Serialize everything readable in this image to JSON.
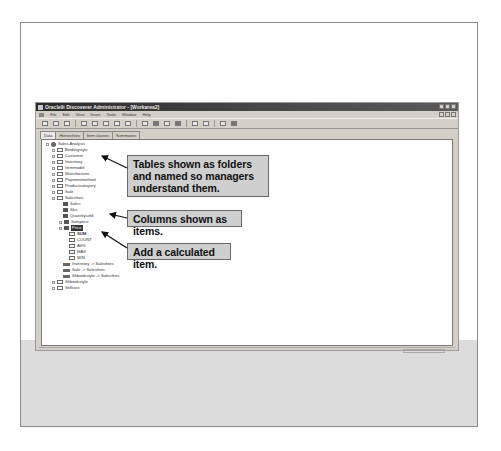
{
  "window": {
    "title": "Oracle9i Discoverer Administrator - [Workarea2]",
    "controls": [
      "minimize",
      "maximize",
      "close"
    ]
  },
  "menubar": {
    "items": [
      "File",
      "Edit",
      "View",
      "Insert",
      "Tools",
      "Window",
      "Help"
    ]
  },
  "toolbar": {
    "icons": [
      "delete-icon",
      "copy-icon",
      "paste-icon",
      "new-folder-icon",
      "new-item-icon",
      "new-join-icon",
      "filter-icon",
      "hierarchy-icon",
      "wand-icon",
      "refresh-icon",
      "properties-icon",
      "help-icon",
      "import-icon",
      "export-icon",
      "zoom-icon",
      "print-icon"
    ]
  },
  "tabs": [
    {
      "label": "Data",
      "active": true
    },
    {
      "label": "Hierarchies",
      "active": false
    },
    {
      "label": "Item classes",
      "active": false
    },
    {
      "label": "Summaries",
      "active": false
    }
  ],
  "tree": {
    "root": "Sales Analysis",
    "folders": [
      "Bindingstyle",
      "Customer",
      "Inventory",
      "Itemmodel",
      "Manufacturer",
      "Paymentmethod",
      "Productcategory",
      "Sale"
    ],
    "expanded_folder": "Salesfees",
    "items": [
      "Sales",
      "Sku",
      "Quantitysold",
      "Saleprice"
    ],
    "selected_item": "Price",
    "aggregates": [
      "SUM",
      "COUNT",
      "AVG",
      "MAX",
      "MIN"
    ],
    "joins": [
      "Inventory -> Salesfees",
      "Sale -> Salesfees",
      "Shbookstyle -> Salesfees"
    ],
    "trailing_folders": [
      "Shbookstyle",
      "Stillcost"
    ]
  },
  "callouts": {
    "tables": "Tables shown as folders and named so managers understand them.",
    "columns": "Columns shown as items.",
    "calculated": "Add a calculated item."
  },
  "colors": {
    "callout_bg": "#cfcfcf",
    "titlebar": "#2a2a2a",
    "app_bg": "#d4d0c8"
  }
}
